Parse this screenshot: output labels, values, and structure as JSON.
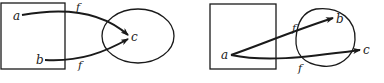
{
  "diagrams": [
    {
      "id": "left",
      "domain_labels": [
        "a",
        "b"
      ],
      "codomain_labels": [
        "c"
      ],
      "function_label_1": "f",
      "function_label_2": "f",
      "mappings": [
        {
          "from": "a",
          "to": "c",
          "label": "f"
        },
        {
          "from": "b",
          "to": "c",
          "label": "f"
        }
      ]
    },
    {
      "id": "right",
      "domain_labels": [
        "a"
      ],
      "codomain_labels": [
        "b",
        "c"
      ],
      "function_label_1": "f",
      "function_label_2": "f",
      "mappings": [
        {
          "from": "a",
          "to": "b",
          "label": "f"
        },
        {
          "from": "a",
          "to": "c",
          "label": "f"
        }
      ]
    }
  ],
  "colors": {
    "ink": "#1a1a1a",
    "background": "#ffffff"
  }
}
